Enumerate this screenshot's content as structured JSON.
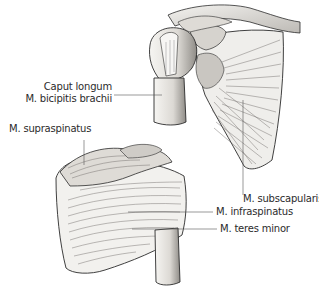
{
  "figure": {
    "views": [
      {
        "id": "anterior",
        "description": "Anterior view of right shoulder: scapula with humerus"
      },
      {
        "id": "posterior",
        "description": "Posterior view of right shoulder: scapula with humerus"
      }
    ],
    "labels": {
      "caput_longum_line1": "Caput longum",
      "caput_longum_line2": "M. bicipitis brachii",
      "supraspinatus": "M. supraspinatus",
      "subscapularis": "M. subscapularis",
      "infraspinatus": "M. infraspinatus",
      "teres_minor": "M. teres minor"
    },
    "colors": {
      "ink": "#2b2b2b",
      "bone_fill": "#e8e6e2",
      "muscle_fill": "#f4f3f1",
      "shadow": "#9a9894",
      "leader_line": "#555555"
    }
  }
}
